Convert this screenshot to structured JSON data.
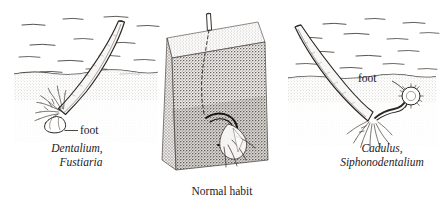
{
  "figure": {
    "background_color": "#ffffff",
    "ink_color": "#24201d",
    "width": 448,
    "height": 205
  },
  "panels": {
    "left": {
      "label_line1": "Dentalium,",
      "label_line2": "Fustiaria",
      "foot_label": "foot",
      "scene": "scaphopod tusk shell angled in sediment, aperture down-left, captacula and foot exposed"
    },
    "center": {
      "caption": "Normal habit",
      "scene": "cutaway sediment block with buried tusk shell, posterior tip protruding above surface"
    },
    "right": {
      "label_line1": "Cadulus,",
      "label_line2": "Siphonodentalium",
      "foot_label": "foot",
      "scene": "scaphopod tusk shell angled in sediment, aperture down-right, disc-shaped foot and captacula exposed"
    }
  },
  "icons": {
    "water_lines": "water-hatch-icon",
    "sediment_stipple": "sediment-stipple-icon",
    "leader_line": "leader-line-icon"
  }
}
